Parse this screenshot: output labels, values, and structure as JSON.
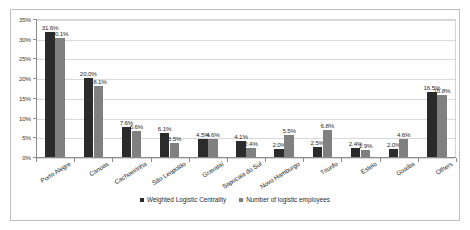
{
  "chart_data": {
    "type": "bar",
    "title": "",
    "subtitle": "",
    "xlabel": "",
    "ylabel": "",
    "ylim": [
      0,
      35
    ],
    "ytick_values": [
      0,
      5,
      10,
      15,
      20,
      25,
      30,
      35
    ],
    "ytick_labels": [
      "0%",
      "5%",
      "10%",
      "15%",
      "20%",
      "25%",
      "30%",
      "35%"
    ],
    "grid": true,
    "legend_position": "bottom",
    "categories": [
      "Porto Alegre",
      "Canoas",
      "Cachoeirinha",
      "São Leopoldo",
      "Gravataí",
      "Sapucaia do Sul",
      "Novo Hamburgo",
      "Triunfo",
      "Esteio",
      "Guaíba",
      "Others"
    ],
    "series": [
      {
        "name": "Weighted Logistic Centrality",
        "color": "#2b2b2b",
        "values": [
          31.6,
          20.0,
          7.6,
          6.1,
          4.5,
          4.1,
          2.0,
          2.5,
          2.4,
          2.0,
          16.5
        ],
        "data_labels": [
          "31.6%",
          "20,0%",
          "7.6%",
          "6.1%",
          "4.5%",
          "4.1%",
          "2.0%",
          "2.5%",
          "2.4%",
          "2.0%",
          "16.5%"
        ]
      },
      {
        "name": "Number of logistic employees",
        "color": "#808080",
        "values": [
          30.1,
          18.1,
          6.6,
          3.5,
          4.6,
          2.4,
          5.5,
          6.8,
          1.9,
          4.6,
          15.8
        ],
        "data_labels": [
          "30.1%",
          "18.1%",
          "6.6%",
          "3.5%",
          "4.6%",
          "2.4%",
          "5.5%",
          "6.8%",
          "1.9%",
          "4.6%",
          "15.8%"
        ]
      }
    ]
  },
  "legend": {
    "items": [
      {
        "label": "Weighted Logistic Centrality"
      },
      {
        "label": "Number of logistic employees"
      }
    ]
  }
}
